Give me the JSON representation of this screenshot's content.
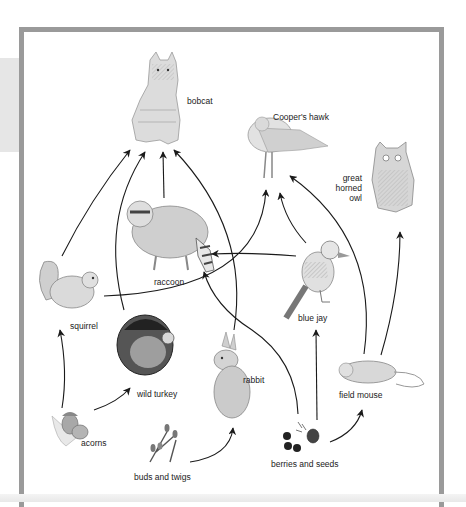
{
  "figure": {
    "type": "food web",
    "colors": {
      "frame_border": "#9a9a9a",
      "side_panel": "#e6e6e6",
      "arrow": "#1a1a1a",
      "background": "#ffffff"
    }
  },
  "organisms": {
    "bobcat": {
      "label": "bobcat"
    },
    "hawk": {
      "label": "Cooper's hawk"
    },
    "owl": {
      "label_lines": [
        "great",
        "horned",
        "owl"
      ]
    },
    "raccoon": {
      "label": "raccoon"
    },
    "squirrel": {
      "label": "squirrel"
    },
    "blue_jay": {
      "label": "blue jay"
    },
    "wild_turkey": {
      "label": "wild turkey"
    },
    "rabbit": {
      "label": "rabbit"
    },
    "field_mouse": {
      "label": "field mouse"
    },
    "acorns": {
      "label": "acorns"
    },
    "buds_twigs": {
      "label": "buds and twigs"
    },
    "berries_seeds": {
      "label": "berries and seeds"
    }
  },
  "feeding_links": [
    {
      "from": "squirrel",
      "to": "bobcat"
    },
    {
      "from": "wild turkey",
      "to": "bobcat"
    },
    {
      "from": "raccoon",
      "to": "bobcat"
    },
    {
      "from": "rabbit",
      "to": "bobcat"
    },
    {
      "from": "squirrel",
      "to": "Cooper's hawk"
    },
    {
      "from": "blue jay",
      "to": "Cooper's hawk"
    },
    {
      "from": "field mouse",
      "to": "Cooper's hawk"
    },
    {
      "from": "field mouse",
      "to": "great horned owl"
    },
    {
      "from": "blue jay",
      "to": "raccoon"
    },
    {
      "from": "berries and seeds",
      "to": "raccoon"
    },
    {
      "from": "acorns",
      "to": "squirrel"
    },
    {
      "from": "acorns",
      "to": "wild turkey"
    },
    {
      "from": "buds and twigs",
      "to": "rabbit"
    },
    {
      "from": "berries and seeds",
      "to": "blue jay"
    },
    {
      "from": "berries and seeds",
      "to": "field mouse"
    }
  ]
}
